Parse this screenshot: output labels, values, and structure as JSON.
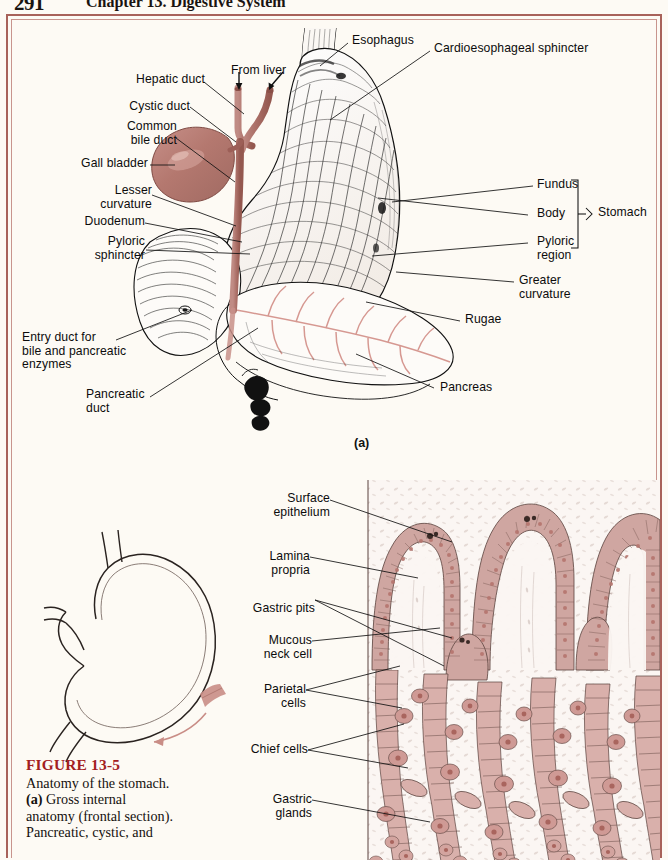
{
  "page": {
    "folio": "291",
    "running_head": "Chapter 13.  Digestive System",
    "background_color": "#fdfaf4",
    "frame_color": "#a8625a"
  },
  "figure": {
    "number": "FIGURE 13-5",
    "number_color": "#a3201f",
    "caption_lines": [
      "Anatomy of the",
      "stomach. (a) Gross",
      "internal anatomy",
      "(frontal section).",
      "Pancreatic, cystic, and"
    ],
    "caption_plain": "Anatomy of the stomach. (a) Gross internal anatomy (frontal section). Pancreatic, cystic, and"
  },
  "panel_a": {
    "marker": "(a)",
    "labels_left": [
      {
        "id": "hepatic-duct",
        "text": "Hepatic duct"
      },
      {
        "id": "cystic-duct",
        "text": "Cystic duct"
      },
      {
        "id": "common-bile-duct",
        "text": "Common\nbile duct"
      },
      {
        "id": "gall-bladder",
        "text": "Gall bladder"
      },
      {
        "id": "lesser-curvature",
        "text": "Lesser\ncurvature"
      },
      {
        "id": "duodenum",
        "text": "Duodenum"
      },
      {
        "id": "pyloric-sphincter",
        "text": "Pyloric\nsphincter"
      },
      {
        "id": "entry-duct",
        "text": "Entry duct for\nbile and pancreatic\nenzymes"
      },
      {
        "id": "pancreatic-duct",
        "text": "Pancreatic\nduct"
      }
    ],
    "labels_top": [
      {
        "id": "from-liver",
        "text": "From liver"
      },
      {
        "id": "esophagus",
        "text": "Esophagus"
      },
      {
        "id": "cardioesophageal-sphincter",
        "text": "Cardioesophageal sphincter"
      }
    ],
    "labels_right": [
      {
        "id": "fundus",
        "text": "Fundus"
      },
      {
        "id": "body",
        "text": "Body"
      },
      {
        "id": "pyloric-region",
        "text": "Pyloric\nregion"
      },
      {
        "id": "greater-curvature",
        "text": "Greater\ncurvature"
      },
      {
        "id": "rugae",
        "text": "Rugae"
      },
      {
        "id": "pancreas",
        "text": "Pancreas"
      }
    ],
    "bracket_label": "Stomach",
    "colors": {
      "gallbladder": "#b4786f",
      "duct": "#b0756c",
      "pancreas_duct": "#d4938c",
      "line_art": "#111111"
    }
  },
  "panel_b": {
    "labels_left": [
      {
        "id": "surface-epithelium",
        "text": "Surface\nepithelium"
      },
      {
        "id": "lamina-propria",
        "text": "Lamina\npropria"
      },
      {
        "id": "gastric-pits",
        "text": "Gastric pits"
      },
      {
        "id": "mucous-neck-cell",
        "text": "Mucous\nneck cell"
      },
      {
        "id": "parietal-cells",
        "text": "Parietal\ncells"
      },
      {
        "id": "chief-cells",
        "text": "Chief cells"
      },
      {
        "id": "gastric-glands",
        "text": "Gastric\nglands"
      }
    ],
    "colors": {
      "epithelium": "#cfa6a1",
      "cell_fill": "#d9b0ab",
      "nucleus": "#b5756e",
      "lumen": "#fbf6f3",
      "outline": "#3a2a26",
      "locator_patch": "#c98d86",
      "locator_arrow": "#c98d86"
    }
  }
}
